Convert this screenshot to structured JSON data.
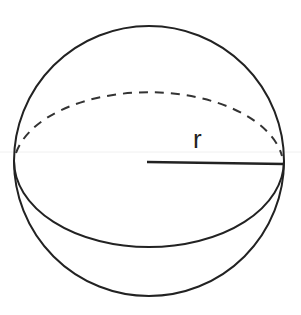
{
  "diagram": {
    "label_radius": "r",
    "colors": {
      "stroke": "#222222",
      "background": "#ffffff"
    },
    "geometry": {
      "center": [
        149,
        161
      ],
      "radius": 135,
      "equator_ry": 75
    }
  }
}
